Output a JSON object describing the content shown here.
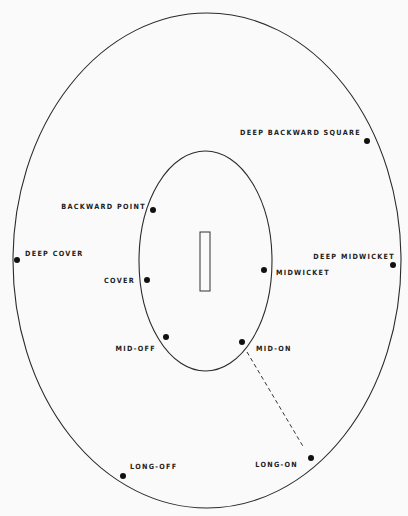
{
  "diagram": {
    "title": "",
    "boundary": {
      "cx": 207,
      "cy": 260.5,
      "rx": 194,
      "ry": 247.5
    },
    "inner_circle": {
      "cx": 205.5,
      "cy": 261,
      "rx": 66.5,
      "ry": 110
    },
    "pitch": {
      "x": 200,
      "y": 232,
      "width": 10,
      "height": 59
    },
    "dashed_line": {
      "from": "mid_on",
      "to": "long_on",
      "x1": 247,
      "y1": 352,
      "x2": 304,
      "y2": 448
    },
    "fielders": [
      {
        "id": "deep_backward_square",
        "label": "DEEP BACKWARD SQUARE",
        "x": 367,
        "y": 141,
        "label_x": 361,
        "label_y": 135,
        "anchor": "end"
      },
      {
        "id": "backward_point",
        "label": "BACKWARD POINT",
        "x": 153,
        "y": 210,
        "label_x": 146,
        "label_y": 209,
        "anchor": "end"
      },
      {
        "id": "deep_cover",
        "label": "DEEP COVER",
        "x": 17,
        "y": 260,
        "label_x": 25,
        "label_y": 256,
        "anchor": "start"
      },
      {
        "id": "deep_midwicket",
        "label": "DEEP MIDWICKET",
        "x": 393,
        "y": 265,
        "label_x": 395,
        "label_y": 259,
        "anchor": "end"
      },
      {
        "id": "midwicket",
        "label": "MIDWICKET",
        "x": 264,
        "y": 270,
        "label_x": 276,
        "label_y": 275,
        "anchor": "start"
      },
      {
        "id": "cover",
        "label": "COVER",
        "x": 147,
        "y": 280,
        "label_x": 135,
        "label_y": 283,
        "anchor": "end"
      },
      {
        "id": "mid_off",
        "label": "MID-OFF",
        "x": 166,
        "y": 337,
        "label_x": 156,
        "label_y": 351,
        "anchor": "end"
      },
      {
        "id": "mid_on",
        "label": "MID-ON",
        "x": 242,
        "y": 342,
        "label_x": 256,
        "label_y": 351,
        "anchor": "start"
      },
      {
        "id": "long_on",
        "label": "LONG-ON",
        "x": 311,
        "y": 458,
        "label_x": 298,
        "label_y": 467,
        "anchor": "end"
      },
      {
        "id": "long_off",
        "label": "LONG-OFF",
        "x": 123,
        "y": 476,
        "label_x": 130,
        "label_y": 469,
        "anchor": "start"
      }
    ],
    "colors": {
      "background": "#fafafa",
      "line": "#2a2a2a",
      "dot": "#111111",
      "text": "#222222"
    }
  }
}
